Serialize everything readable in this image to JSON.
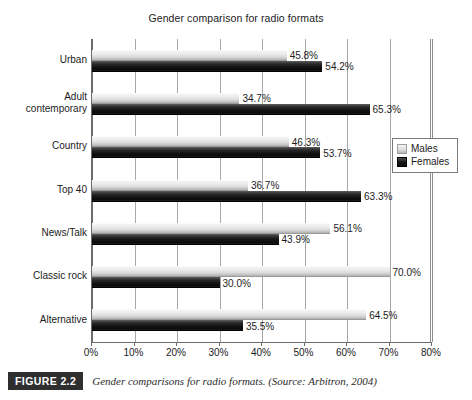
{
  "chart_data": {
    "type": "bar",
    "orientation": "horizontal",
    "title": "Gender comparison for radio formats",
    "xlabel": "",
    "ylabel": "",
    "xlim": [
      0,
      80
    ],
    "xticks": [
      "0%",
      "10%",
      "20%",
      "30%",
      "40%",
      "50%",
      "60%",
      "70%",
      "80%"
    ],
    "xtick_values": [
      0,
      10,
      20,
      30,
      40,
      50,
      60,
      70,
      80
    ],
    "grid": true,
    "legend_position": "right",
    "categories": [
      "Urban",
      "Adult contemporary",
      "Country",
      "Top 40",
      "News/Talk",
      "Classic rock",
      "Alternative"
    ],
    "category_lines": [
      [
        "Urban"
      ],
      [
        "Adult",
        "contemporary"
      ],
      [
        "Country"
      ],
      [
        "Top 40"
      ],
      [
        "News/Talk"
      ],
      [
        "Classic rock"
      ],
      [
        "Alternative"
      ]
    ],
    "series": [
      {
        "name": "Males",
        "color": "#dcdcdc",
        "values": [
          45.8,
          34.7,
          46.3,
          36.7,
          56.1,
          70.0,
          64.5
        ],
        "labels": [
          "45.8%",
          "34.7%",
          "46.3%",
          "36.7%",
          "56.1%",
          "70.0%",
          "64.5%"
        ]
      },
      {
        "name": "Females",
        "color": "#111111",
        "values": [
          54.2,
          65.3,
          53.7,
          63.3,
          43.9,
          30.0,
          35.5
        ],
        "labels": [
          "54.2%",
          "65.3%",
          "53.7%",
          "63.3%",
          "43.9%",
          "30.0%",
          "35.5%"
        ]
      }
    ]
  },
  "legend": {
    "items": [
      {
        "label": "Males",
        "swatch": "males"
      },
      {
        "label": "Females",
        "swatch": "females"
      }
    ]
  },
  "caption": {
    "badge": "FIGURE 2.2",
    "text": "Gender comparisons for radio formats. (Source: Arbitron, 2004)"
  }
}
